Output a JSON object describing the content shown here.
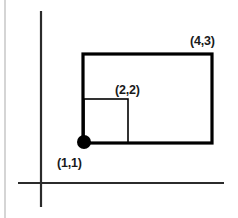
{
  "figure": {
    "background_color": "#ffffff",
    "width": 238,
    "height": 218
  },
  "page_border": {
    "name": "page-edge-rule",
    "color": "#b9b9b9",
    "x": 5,
    "y1": 0,
    "y2": 218,
    "stroke_width": 1.2
  },
  "axes": {
    "color": "#2b2b2b",
    "stroke_width": 2.2,
    "x_axis": {
      "label": "x-axis",
      "y": 183,
      "x1": 18,
      "x2": 224
    },
    "y_axis": {
      "label": "y-axis",
      "x": 41,
      "y1": 11,
      "y2": 207
    }
  },
  "shapes": {
    "outer_rectangle": {
      "name": "outer-rectangle",
      "stroke_color": "#000000",
      "stroke_width": 3.2,
      "fill": "none",
      "x": 83,
      "y": 54,
      "width": 129,
      "height": 89,
      "corner_from": "(1,1)",
      "corner_to": "(4,3)"
    },
    "inner_square": {
      "name": "inner-square",
      "stroke_color": "#000000",
      "stroke_width": 1.6,
      "fill": "none",
      "x": 84,
      "y": 99,
      "width": 44,
      "height": 44,
      "corner_from": "(1,1)",
      "corner_to": "(2,2)"
    },
    "origin_point": {
      "name": "anchor-point",
      "fill_color": "#000000",
      "cx": 84,
      "cy": 142,
      "r": 7
    }
  },
  "labels": [
    {
      "id": "label-4-3",
      "text": "(4,3)",
      "x": 190,
      "y": 45,
      "anchor": "start"
    },
    {
      "id": "label-2-2",
      "text": "(2,2)",
      "x": 115,
      "y": 94,
      "anchor": "start"
    },
    {
      "id": "label-1-1",
      "text": "(1,1)",
      "x": 57,
      "y": 167,
      "anchor": "start"
    }
  ]
}
